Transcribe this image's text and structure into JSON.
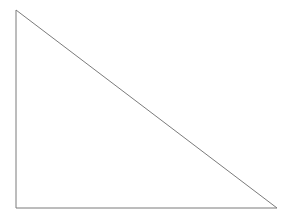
{
  "canvas": {
    "width": 293,
    "height": 220,
    "background_color": "#ffffff"
  },
  "figure": {
    "name": "right-triangle",
    "stroke_color": "#7b7b7b",
    "stroke_width": 1,
    "fill": "none",
    "vertices": [
      {
        "label": "apex-top-left",
        "x": 16,
        "y": 10
      },
      {
        "label": "right-angle-bottom-left",
        "x": 16,
        "y": 208
      },
      {
        "label": "bottom-right",
        "x": 277,
        "y": 208
      }
    ],
    "points_attr": "16,10 16,208 277,208 16,10",
    "edges": [
      {
        "name": "vertical-leg",
        "from": "apex-top-left",
        "to": "right-angle-bottom-left",
        "length": 198
      },
      {
        "name": "horizontal-leg",
        "from": "right-angle-bottom-left",
        "to": "bottom-right",
        "length": 261
      },
      {
        "name": "hypotenuse",
        "from": "bottom-right",
        "to": "apex-top-left",
        "length": 327.6
      }
    ]
  }
}
